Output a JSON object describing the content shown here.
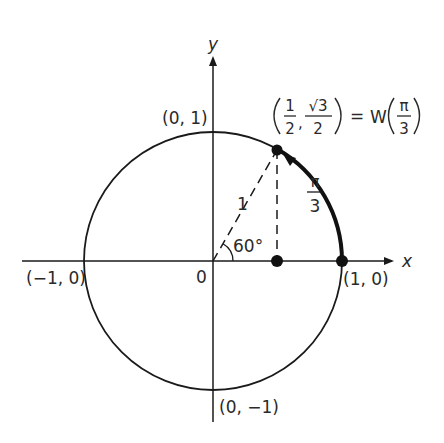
{
  "diagram": {
    "type": "unit-circle",
    "colors": {
      "ink": "#1a1a1a",
      "background": "#ffffff"
    },
    "axes": {
      "x_label": "x",
      "y_label": "y",
      "origin_label": "0"
    },
    "intercepts": {
      "top": "(0, 1)",
      "bottom": "(0, −1)",
      "left": "(−1, 0)",
      "right": "(1, 0)"
    },
    "point": {
      "x_num": "1",
      "x_den": "2",
      "y_num": "√3",
      "y_den": "2",
      "equals": "=",
      "func": "W",
      "arg_num": "π",
      "arg_den": "3"
    },
    "radius_label": "1",
    "angle_label": "60°",
    "arc_label": {
      "num": "π",
      "den": "3"
    }
  }
}
